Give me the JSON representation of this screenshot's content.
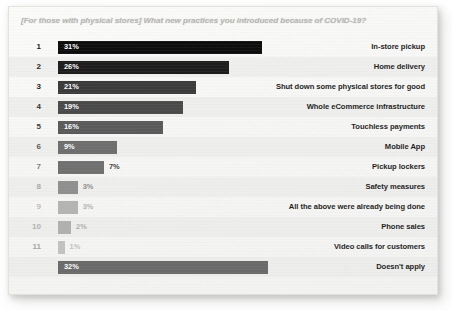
{
  "chart_data": {
    "type": "bar",
    "title": "[For those with physical stores] What new practices you introduced because of COVID-19?",
    "xlabel": "",
    "ylabel": "",
    "orientation": "horizontal",
    "grid": false,
    "legend": false,
    "xlim": [
      0,
      35
    ],
    "value_suffix": "%",
    "categories": [
      "In-store pickup",
      "Home delivery",
      "Shut down some physical stores for good",
      "Whole eCommerce infrastructure",
      "Touchless payments",
      "Mobile App",
      "Pickup lockers",
      "Safety measures",
      "All the above were already being done",
      "Phone sales",
      "Video calls for customers",
      "Doesn't apply"
    ],
    "values": [
      31,
      26,
      21,
      19,
      16,
      9,
      7,
      3,
      3,
      2,
      1,
      32
    ],
    "rows": [
      {
        "rank": "1",
        "value": 31,
        "value_label": "31%",
        "label": "In-store pickup",
        "color": "#0d0d0d",
        "rank_color": "#1b1b1b",
        "label_inside": true,
        "stripe": false
      },
      {
        "rank": "2",
        "value": 26,
        "value_label": "26%",
        "label": "Home delivery",
        "color": "#1d1d1d",
        "rank_color": "#1d1d1d",
        "label_inside": true,
        "stripe": true
      },
      {
        "rank": "3",
        "value": 21,
        "value_label": "21%",
        "label": "Shut down some physical stores for good",
        "color": "#3b3b3b",
        "rank_color": "#242424",
        "label_inside": true,
        "stripe": false
      },
      {
        "rank": "4",
        "value": 19,
        "value_label": "19%",
        "label": "Whole eCommerce infrastructure",
        "color": "#4a4a4a",
        "rank_color": "#303030",
        "label_inside": true,
        "stripe": true
      },
      {
        "rank": "5",
        "value": 16,
        "value_label": "16%",
        "label": "Touchless payments",
        "color": "#5a5a5a",
        "rank_color": "#3a3a3a",
        "label_inside": true,
        "stripe": false
      },
      {
        "rank": "6",
        "value": 9,
        "value_label": "9%",
        "label": "Mobile App",
        "color": "#6e6e6e",
        "rank_color": "#585858",
        "label_inside": true,
        "stripe": true
      },
      {
        "rank": "7",
        "value": 7,
        "value_label": "7%",
        "label": "Pickup lockers",
        "color": "#707070",
        "rank_color": "#7d7d7d",
        "label_inside": false,
        "stripe": false
      },
      {
        "rank": "8",
        "value": 3,
        "value_label": "3%",
        "label": "Safety measures",
        "color": "#8f8f8f",
        "rank_color": "#a8a8a6",
        "label_inside": false,
        "stripe": true
      },
      {
        "rank": "9",
        "value": 3,
        "value_label": "3%",
        "label": "All the above were already being done",
        "color": "#b4b4b2",
        "rank_color": "#bdbdbb",
        "label_inside": false,
        "stripe": false
      },
      {
        "rank": "10",
        "value": 2,
        "value_label": "2%",
        "label": "Phone sales",
        "color": "#b0b0ae",
        "rank_color": "#b2b2b0",
        "label_inside": false,
        "stripe": true
      },
      {
        "rank": "11",
        "value": 1,
        "value_label": "1%",
        "label": "Video calls for customers",
        "color": "#c2c2c0",
        "rank_color": "#a5a5a3",
        "label_inside": false,
        "stripe": false
      },
      {
        "rank": "",
        "value": 32,
        "value_label": "32%",
        "label": "Doesn't apply",
        "color": "#6a6a6a",
        "rank_color": "#6a6a6a",
        "label_inside": true,
        "stripe": true
      }
    ]
  }
}
